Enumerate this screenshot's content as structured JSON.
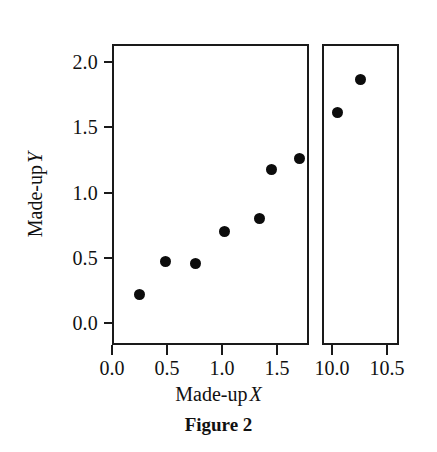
{
  "figure": {
    "caption": "Figure 2",
    "axis_color": "#1a1a1a",
    "point_color": "#0c0c0c",
    "background": "#ffffff"
  },
  "axes": {
    "y_title_text": "Made-up",
    "y_title_symbol": "Y",
    "x_title_text": "Made-up",
    "x_title_symbol": "X",
    "y_ticks": [
      "2.0",
      "1.5",
      "1.0",
      "0.5",
      "0.0"
    ],
    "x_ticks_left": [
      "0.0",
      "0.5",
      "1.0",
      "1.5"
    ],
    "x_ticks_right": [
      "10.0",
      "10.5"
    ]
  },
  "chart_data": {
    "type": "scatter",
    "title": "Figure 2",
    "xlabel": "Made-up X",
    "ylabel": "Made-up Y",
    "grid": false,
    "legend": "none",
    "broken_axis": true,
    "panels": [
      {
        "name": "left-panel",
        "xlim": [
          0.0,
          1.79
        ],
        "ylim": [
          -0.17,
          2.14
        ],
        "xticks": [
          0.0,
          0.5,
          1.0,
          1.5
        ],
        "yticks": [
          0.0,
          0.5,
          1.0,
          1.5,
          2.0
        ],
        "points": [
          {
            "x": 0.23,
            "y": 0.23
          },
          {
            "x": 0.47,
            "y": 0.49
          },
          {
            "x": 0.74,
            "y": 0.47
          },
          {
            "x": 1.0,
            "y": 0.72
          },
          {
            "x": 1.32,
            "y": 0.82
          },
          {
            "x": 1.43,
            "y": 1.19
          },
          {
            "x": 1.69,
            "y": 1.28
          }
        ]
      },
      {
        "name": "right-panel",
        "xlim": [
          9.91,
          10.61
        ],
        "ylim": [
          -0.17,
          2.14
        ],
        "xticks": [
          10.0,
          10.5
        ],
        "yticks": [],
        "points": [
          {
            "x": 10.03,
            "y": 1.63
          },
          {
            "x": 10.24,
            "y": 1.88
          }
        ]
      }
    ]
  }
}
